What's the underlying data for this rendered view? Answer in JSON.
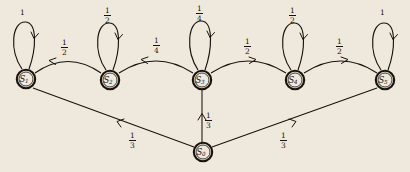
{
  "diagram": {
    "type": "markov-chain-state-diagram",
    "background_color": "#efe9dd",
    "ink_color": "#17120c",
    "states": [
      {
        "id": "S0",
        "label": "S",
        "subscript": "0",
        "x": 203,
        "y": 152
      },
      {
        "id": "S1",
        "label": "S",
        "subscript": "1",
        "x": 26,
        "y": 79
      },
      {
        "id": "S2",
        "label": "S",
        "subscript": "2",
        "x": 110,
        "y": 80
      },
      {
        "id": "S3",
        "label": "S",
        "subscript": "3",
        "x": 202,
        "y": 80
      },
      {
        "id": "S4",
        "label": "S",
        "subscript": "4",
        "x": 295,
        "y": 80
      },
      {
        "id": "S5",
        "label": "S",
        "subscript": "5",
        "x": 385,
        "y": 80
      }
    ],
    "self_loops": [
      {
        "state": "S1",
        "numerator": "1",
        "denominator": "",
        "whole": "1",
        "label_x": 23,
        "label_y": 9
      },
      {
        "state": "S2",
        "numerator": "1",
        "denominator": "2",
        "whole": "",
        "label_x": 106,
        "label_y": 8
      },
      {
        "state": "S3",
        "numerator": "1",
        "denominator": "4",
        "whole": "",
        "label_x": 198,
        "label_y": 6
      },
      {
        "state": "S4",
        "numerator": "1",
        "denominator": "2",
        "whole": "",
        "label_x": 291,
        "label_y": 8
      },
      {
        "state": "S5",
        "numerator": "1",
        "denominator": "",
        "whole": "1",
        "label_x": 383,
        "label_y": 9
      }
    ],
    "transitions": [
      {
        "from": "S2",
        "to": "S1",
        "numerator": "1",
        "denominator": "2",
        "label_x": 63,
        "label_y": 40
      },
      {
        "from": "S3",
        "to": "S2",
        "numerator": "1",
        "denominator": "4",
        "label_x": 155,
        "label_y": 38
      },
      {
        "from": "S3",
        "to": "S4",
        "numerator": "1",
        "denominator": "2",
        "label_x": 246,
        "label_y": 39
      },
      {
        "from": "S4",
        "to": "S5",
        "numerator": "1",
        "denominator": "2",
        "label_x": 338,
        "label_y": 39
      },
      {
        "from": "S0",
        "to": "S1",
        "numerator": "1",
        "denominator": "3",
        "label_x": 131,
        "label_y": 133
      },
      {
        "from": "S0",
        "to": "S3",
        "numerator": "1",
        "denominator": "3",
        "label_x": 207,
        "label_y": 113
      },
      {
        "from": "S0",
        "to": "S5",
        "numerator": "1",
        "denominator": "3",
        "label_x": 282,
        "label_y": 133
      }
    ]
  }
}
